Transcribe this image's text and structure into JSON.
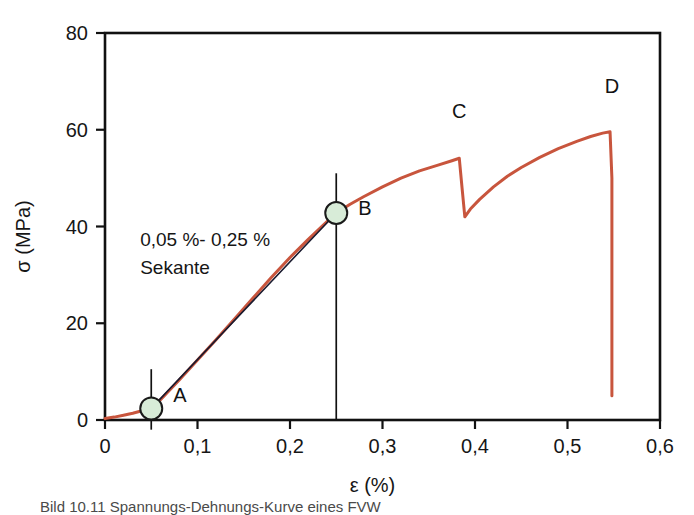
{
  "figure": {
    "background": "#ffffff",
    "caption": "Bild 10.11 Spannungs-Dehnungs-Kurve eines FVW"
  },
  "chart_data": {
    "type": "line",
    "title": "",
    "xlabel": "ε (%)",
    "ylabel": "σ (MPa)",
    "xlim": [
      0,
      0.6
    ],
    "ylim": [
      0,
      80
    ],
    "xticks": [
      0,
      0.1,
      0.2,
      0.3,
      0.4,
      0.5,
      0.6
    ],
    "xticklabels": [
      "0",
      "0,1",
      "0,2",
      "0,3",
      "0,4",
      "0,5",
      "0,6"
    ],
    "yticks": [
      0,
      20,
      40,
      60,
      80
    ],
    "yticklabels": [
      "0",
      "20",
      "40",
      "60",
      "80"
    ],
    "grid": false,
    "legend": "none",
    "frame": [
      "left",
      "bottom",
      "top",
      "right"
    ],
    "series": [
      {
        "name": "stress-strain-curve",
        "color": "#c8553d",
        "width": 3,
        "points": [
          [
            0.0,
            0.3
          ],
          [
            0.01,
            0.6
          ],
          [
            0.02,
            1.0
          ],
          [
            0.03,
            1.4
          ],
          [
            0.04,
            1.9
          ],
          [
            0.05,
            2.4
          ],
          [
            0.06,
            4.2
          ],
          [
            0.08,
            8.2
          ],
          [
            0.1,
            12.4
          ],
          [
            0.12,
            16.6
          ],
          [
            0.14,
            20.9
          ],
          [
            0.16,
            25.2
          ],
          [
            0.18,
            29.5
          ],
          [
            0.2,
            33.6
          ],
          [
            0.22,
            37.4
          ],
          [
            0.24,
            41.0
          ],
          [
            0.25,
            42.8
          ],
          [
            0.265,
            44.6
          ],
          [
            0.28,
            46.2
          ],
          [
            0.3,
            48.2
          ],
          [
            0.32,
            50.0
          ],
          [
            0.34,
            51.5
          ],
          [
            0.36,
            52.7
          ],
          [
            0.375,
            53.6
          ],
          [
            0.383,
            54.1
          ],
          [
            0.386,
            48.0
          ],
          [
            0.389,
            42.0
          ],
          [
            0.395,
            43.6
          ],
          [
            0.405,
            45.6
          ],
          [
            0.42,
            48.2
          ],
          [
            0.435,
            50.4
          ],
          [
            0.45,
            52.2
          ],
          [
            0.47,
            54.3
          ],
          [
            0.49,
            56.1
          ],
          [
            0.51,
            57.6
          ],
          [
            0.525,
            58.6
          ],
          [
            0.538,
            59.3
          ],
          [
            0.546,
            59.6
          ],
          [
            0.548,
            50.0
          ],
          [
            0.548,
            30.0
          ],
          [
            0.548,
            12.0
          ],
          [
            0.548,
            5.0
          ]
        ]
      },
      {
        "name": "secant-0.05-0.25",
        "color": "#1a1a2e",
        "width": 1.6,
        "points": [
          [
            0.05,
            2.4
          ],
          [
            0.25,
            42.8
          ]
        ]
      }
    ],
    "markers": [
      {
        "label": "A",
        "x": 0.05,
        "y": 2.4,
        "radius": 11,
        "fill": "#d8ecd8",
        "stroke": "#1a1a1a",
        "label_dx": 22,
        "label_dy": -6,
        "dropline": {
          "from_y": 10.5,
          "to_y": -2.0
        }
      },
      {
        "label": "B",
        "x": 0.25,
        "y": 42.8,
        "radius": 11,
        "fill": "#d8ecd8",
        "stroke": "#1a1a1a",
        "label_dx": 22,
        "label_dy": 2,
        "dropline": {
          "from_y": 51.0,
          "to_y": 0.0
        }
      }
    ],
    "annotations": [
      {
        "name": "point-label-c",
        "text": "C",
        "x": 0.383,
        "y": 62.5
      },
      {
        "name": "point-label-d",
        "text": "D",
        "x": 0.548,
        "y": 67.5
      },
      {
        "name": "secant-note-line1",
        "text": "0,05 %- 0,25 %",
        "x": 0.038,
        "y": 36.0
      },
      {
        "name": "secant-note-line2",
        "text": "Sekante",
        "x": 0.038,
        "y": 30.2
      }
    ]
  }
}
